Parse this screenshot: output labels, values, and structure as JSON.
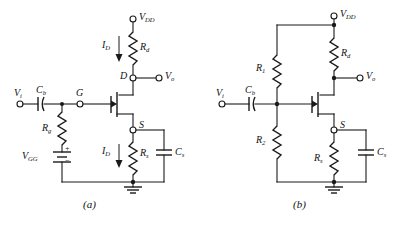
{
  "figure": {
    "ink_color": "#1a1a1a",
    "background_color": "#ffffff"
  },
  "captions": {
    "left": "(a)",
    "right": "(b)"
  },
  "circuit_a": {
    "name": "fixed-bias-circuit",
    "labels": {
      "supply": "V",
      "supply_sub": "DD",
      "drain_resistor": "R",
      "drain_resistor_sub": "d",
      "drain_current_top": "I",
      "drain_current_top_sub": "D",
      "drain_node": "D",
      "output": "V",
      "output_sub": "o",
      "input": "V",
      "input_sub": "i",
      "coupling_cap": "C",
      "coupling_cap_sub": "b",
      "gate_node": "G",
      "gate_resistor": "R",
      "gate_resistor_sub": "g",
      "gate_supply": "V",
      "gate_supply_sub": "GG",
      "battery_plus": "+",
      "battery_minus": "−",
      "source_node": "S",
      "source_current": "I",
      "source_current_sub": "D",
      "source_resistor": "R",
      "source_resistor_sub": "s",
      "source_cap": "C",
      "source_cap_sub": "s"
    }
  },
  "circuit_b": {
    "name": "voltage-divider-bias-circuit",
    "labels": {
      "supply": "V",
      "supply_sub": "DD",
      "drain_resistor": "R",
      "drain_resistor_sub": "d",
      "output": "V",
      "output_sub": "o",
      "input": "V",
      "input_sub": "i",
      "coupling_cap": "C",
      "coupling_cap_sub": "b",
      "divider_top_resistor": "R",
      "divider_top_resistor_sub": "1",
      "divider_bottom_resistor": "R",
      "divider_bottom_resistor_sub": "2",
      "source_node": "S",
      "source_resistor": "R",
      "source_resistor_sub": "s",
      "source_cap": "C",
      "source_cap_sub": "s"
    }
  }
}
